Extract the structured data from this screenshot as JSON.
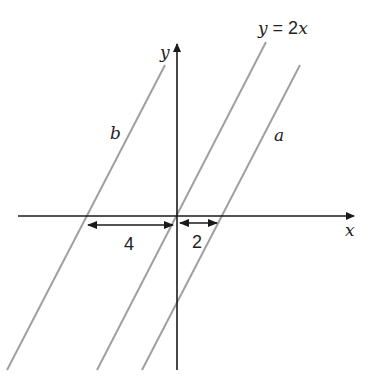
{
  "diagram": {
    "axes": {
      "x_label": "x",
      "y_label": "y",
      "axis_color": "#1a1a1a"
    },
    "lines": [
      {
        "id": "y2x",
        "label": "y = 2x",
        "label_parts": {
          "lhs": "y",
          "eq": " = 2",
          "var": "x"
        },
        "color": "#9a9a9a"
      },
      {
        "id": "a",
        "label": "a",
        "color": "#9a9a9a"
      },
      {
        "id": "b",
        "label": "b",
        "color": "#9a9a9a"
      }
    ],
    "measurements": [
      {
        "label": "4",
        "description": "horizontal distance from line b to origin"
      },
      {
        "label": "2",
        "description": "horizontal distance from origin to line a"
      }
    ]
  }
}
